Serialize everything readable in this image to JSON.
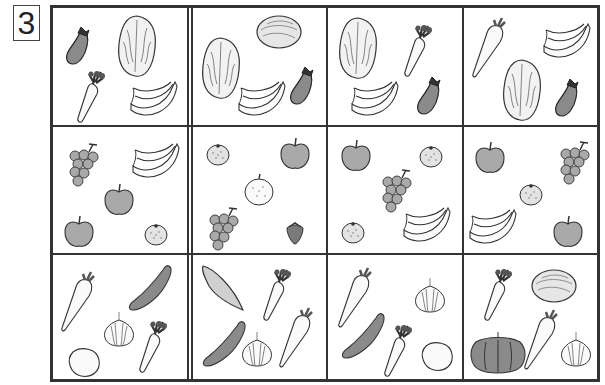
{
  "worksheet": {
    "problem_number": "3",
    "grid": {
      "rows": 3,
      "columns": 4,
      "cells": [
        [
          {
            "items": [
              "eggplant",
              "napa-cabbage",
              "carrot",
              "banana"
            ]
          },
          {
            "items": [
              "napa-cabbage",
              "cabbage",
              "banana",
              "eggplant"
            ]
          },
          {
            "items": [
              "napa-cabbage",
              "carrot",
              "banana",
              "eggplant"
            ]
          },
          {
            "items": [
              "daikon",
              "banana",
              "napa-cabbage",
              "eggplant"
            ]
          }
        ],
        [
          {
            "items": [
              "grapes",
              "banana",
              "apple",
              "apple",
              "mandarin-orange"
            ]
          },
          {
            "items": [
              "mandarin-orange",
              "apple",
              "pear",
              "grapes",
              "strawberry"
            ]
          },
          {
            "items": [
              "apple",
              "mandarin-orange",
              "grapes",
              "mandarin-orange",
              "banana"
            ]
          },
          {
            "items": [
              "apple",
              "grapes",
              "mandarin-orange",
              "banana",
              "apple"
            ]
          }
        ],
        [
          {
            "items": [
              "daikon",
              "cucumber",
              "onion",
              "potato",
              "carrot"
            ]
          },
          {
            "items": [
              "sweet-potato",
              "carrot",
              "cucumber",
              "onion",
              "daikon"
            ]
          },
          {
            "items": [
              "daikon",
              "onion",
              "cucumber",
              "carrot",
              "potato"
            ]
          },
          {
            "items": [
              "carrot",
              "cabbage",
              "pumpkin",
              "daikon",
              "onion"
            ]
          }
        ]
      ]
    },
    "colors": {
      "line": "#333333",
      "fill_dark": "#8a8a8a",
      "fill_mid": "#a9a9a9",
      "fill_light": "#d6d6d6",
      "background": "#ffffff"
    }
  }
}
